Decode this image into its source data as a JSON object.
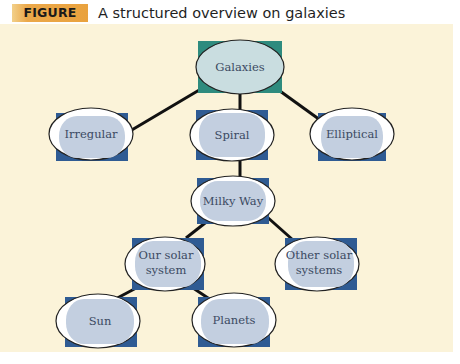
{
  "figure": {
    "label": "FIGURE 8.6",
    "title": "A structured overview on galaxies"
  },
  "colors": {
    "panel_bg": "#fbf3d9",
    "label_bg": "#e9a23e",
    "node_fill": "#c3cfe0",
    "root_fill": "#c9dde0",
    "corner_blue": "#2f5b93",
    "corner_teal": "#2e8b7e",
    "connector": "#111111"
  },
  "nodes": {
    "galaxies": {
      "label": "Galaxies"
    },
    "irregular": {
      "label": "Irregular"
    },
    "spiral": {
      "label": "Spiral"
    },
    "elliptical": {
      "label": "Elliptical"
    },
    "milky_way": {
      "label": "Milky Way"
    },
    "our_solar_system": {
      "line1": "Our solar",
      "line2": "system"
    },
    "other_solar_systems": {
      "line1": "Other solar",
      "line2": "systems"
    },
    "sun": {
      "label": "Sun"
    },
    "planets": {
      "label": "Planets"
    }
  },
  "edges": [
    [
      "galaxies",
      "irregular"
    ],
    [
      "galaxies",
      "spiral"
    ],
    [
      "galaxies",
      "elliptical"
    ],
    [
      "spiral",
      "milky_way"
    ],
    [
      "milky_way",
      "our_solar_system"
    ],
    [
      "milky_way",
      "other_solar_systems"
    ],
    [
      "our_solar_system",
      "sun"
    ],
    [
      "our_solar_system",
      "planets"
    ]
  ]
}
